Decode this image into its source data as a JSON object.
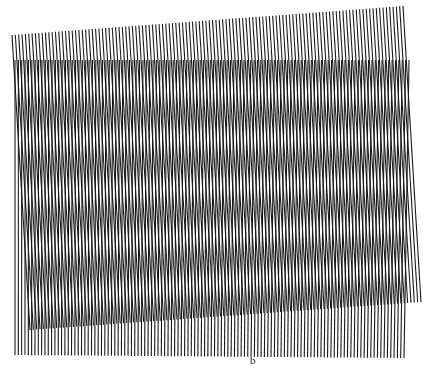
{
  "figure": {
    "label": "b",
    "line_color": "#1a1a1a",
    "background": "#ffffff"
  },
  "gratings": [
    {
      "name": "grating-a-tilted",
      "count": 118,
      "top_left": [
        12,
        35
      ],
      "top_right": [
        403,
        6
      ],
      "bottom_left": [
        30,
        330
      ],
      "bottom_right": [
        421,
        302
      ],
      "stroke_width": 1.1
    },
    {
      "name": "grating-b-vertical",
      "count": 118,
      "top_left": [
        15,
        60
      ],
      "top_right": [
        409,
        60
      ],
      "bottom_left": [
        15,
        355
      ],
      "bottom_right": [
        404,
        358
      ],
      "stroke_width": 1.1
    }
  ]
}
